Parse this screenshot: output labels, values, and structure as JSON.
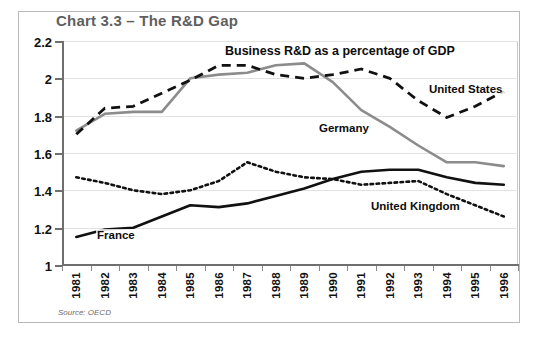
{
  "chart_title": "Chart 3.3 – The R&D Gap",
  "source_note": "Source: OECD",
  "annotations": {
    "header": "Business R&D as a percentage of GDP",
    "united_states": "United States",
    "germany": "Germany",
    "france": "France",
    "united_kingdom": "United Kingdom"
  },
  "colors": {
    "title": "#5f5f5f",
    "germany_line": "#8c8c8c",
    "us_line": "#111111",
    "france_line": "#111111",
    "uk_line": "#111111",
    "grid": "#e2e2e2",
    "axis": "#6f6f6f",
    "frame": "#b9b9b9"
  },
  "chart_data": {
    "type": "line",
    "title": "Chart 3.3 – The R&D Gap",
    "subtitle": "Business R&D as a percentage of GDP",
    "xlabel": "",
    "ylabel": "",
    "xlim": [
      1981,
      1996
    ],
    "ylim": [
      1,
      2.2
    ],
    "ytick_step": 0.2,
    "grid": true,
    "legend": "inline-annotations",
    "categories": [
      1981,
      1982,
      1983,
      1984,
      1985,
      1986,
      1987,
      1988,
      1989,
      1990,
      1991,
      1992,
      1993,
      1994,
      1995,
      1996
    ],
    "ytick_labels": [
      "1",
      "1.2",
      "1.4",
      "1.6",
      "1.8",
      "2",
      "2.2"
    ],
    "xtick_labels": [
      "1981",
      "1982",
      "1983",
      "1984",
      "1985",
      "1986",
      "1987",
      "1988",
      "1989",
      "1990",
      "1991",
      "1992",
      "1993",
      "1994",
      "1995",
      "1996"
    ],
    "series": [
      {
        "name": "United States",
        "style": "dashed",
        "color": "#111111",
        "values": [
          1.7,
          1.84,
          1.85,
          1.92,
          1.99,
          2.07,
          2.07,
          2.02,
          2.0,
          2.02,
          2.05,
          2.0,
          1.88,
          1.79,
          1.85,
          1.93
        ]
      },
      {
        "name": "Germany",
        "style": "solid",
        "color": "#8c8c8c",
        "values": [
          1.72,
          1.81,
          1.82,
          1.82,
          2.0,
          2.02,
          2.03,
          2.07,
          2.08,
          1.98,
          1.83,
          1.74,
          1.64,
          1.55,
          1.55,
          1.53
        ]
      },
      {
        "name": "France",
        "style": "solid",
        "color": "#111111",
        "values": [
          1.15,
          1.19,
          1.2,
          1.26,
          1.32,
          1.31,
          1.33,
          1.37,
          1.41,
          1.46,
          1.5,
          1.51,
          1.51,
          1.47,
          1.44,
          1.43
        ]
      },
      {
        "name": "United Kingdom",
        "style": "dotted",
        "color": "#111111",
        "values": [
          1.47,
          1.44,
          1.4,
          1.38,
          1.4,
          1.45,
          1.55,
          1.5,
          1.47,
          1.46,
          1.43,
          1.44,
          1.45,
          1.38,
          1.32,
          1.26
        ]
      }
    ]
  }
}
